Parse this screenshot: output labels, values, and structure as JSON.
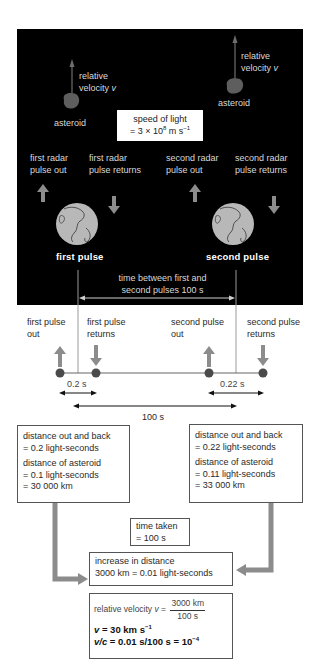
{
  "panel": {
    "asteroid_left": {
      "velocity_label_1": "relative",
      "velocity_label_2": "velocity",
      "velocity_symbol": "v",
      "label": "asteroid"
    },
    "asteroid_right": {
      "velocity_label_1": "relative",
      "velocity_label_2": "velocity",
      "velocity_symbol": "v",
      "label": "asteroid"
    },
    "speed_of_light": {
      "line1": "speed of light",
      "line2_prefix": "= 3 × 10",
      "line2_exp": "8",
      "line2_unit": " m s",
      "line2_unit_exp": "−1"
    },
    "pulse_labels": [
      {
        "line1": "first radar",
        "line2": "pulse out"
      },
      {
        "line1": "first radar",
        "line2": "pulse returns"
      },
      {
        "line1": "second radar",
        "line2": "pulse out"
      },
      {
        "line1": "second radar",
        "line2": "pulse returns"
      }
    ],
    "earth_labels": [
      "first pulse",
      "second pulse"
    ],
    "time_between": {
      "line1": "time between first and",
      "line2": "second pulses 100 s"
    }
  },
  "timeline": {
    "labels": [
      {
        "line1": "first pulse",
        "line2": "out"
      },
      {
        "line1": "first pulse",
        "line2": "returns"
      },
      {
        "line1": "second pulse",
        "line2": "out"
      },
      {
        "line1": "second pulse",
        "line2": "returns"
      }
    ],
    "interval_1": "0.2 s",
    "interval_2": "0.22 s",
    "interval_total": "100 s"
  },
  "boxes": {
    "left": {
      "line1": "distance out and back",
      "line2": "= 0.2 light-seconds",
      "line3": "distance of asteroid",
      "line4": "= 0.1 light-seconds",
      "line5": "= 30 000 km"
    },
    "right": {
      "line1": "distance out and back",
      "line2": "= 0.22 light-seconds",
      "line3": "distance of asteroid",
      "line4": "= 0.11 light-seconds",
      "line5": "= 33 000 km"
    },
    "time_taken": {
      "line1": "time taken",
      "line2": "= 100 s"
    },
    "increase": {
      "line1": "increase in distance",
      "line2": "3000 km = 0.01 light-seconds"
    },
    "result": {
      "prefix": "relative velocity ",
      "symbol": "v",
      "equals": " =",
      "numerator": "3000 km",
      "denominator": "100 s",
      "v_line_prefix": "v",
      "v_line_value": " = 30 km s",
      "v_line_exp": "−1",
      "ratio_prefix": "v/c",
      "ratio_value": " = 0.01 s/100 s = 10",
      "ratio_exp": "−4"
    }
  },
  "colors": {
    "panel_bg": "#000000",
    "arrow_gray": "#8c8c8c",
    "dot_dark": "#4a4a4a",
    "asteroid_gray": "#5e5e5e",
    "earth_gray": "#b8b8b8"
  }
}
